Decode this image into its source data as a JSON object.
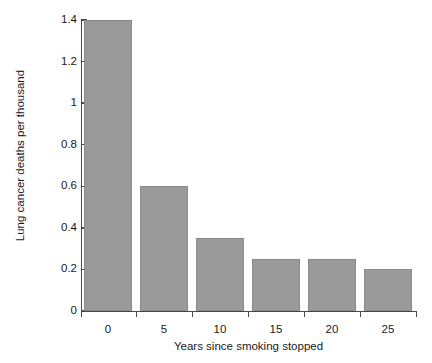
{
  "chart_data": {
    "type": "bar",
    "title": "",
    "xlabel": "Years since smoking stopped",
    "ylabel": "Lung cancer deaths per thousand",
    "categories": [
      "0",
      "5",
      "10",
      "15",
      "20",
      "25"
    ],
    "values": [
      1.4,
      0.6,
      0.35,
      0.25,
      0.25,
      0.2
    ],
    "series": [
      {
        "name": "Lung cancer deaths per thousand",
        "values": [
          1.4,
          0.6,
          0.35,
          0.25,
          0.25,
          0.2
        ]
      }
    ],
    "ylim": [
      0,
      1.4
    ],
    "yticks": [
      "0",
      "0.2",
      "0.4",
      "0.6",
      "0.8",
      "1",
      "1.2",
      "1.4"
    ],
    "ytick_values": [
      0,
      0.2,
      0.4,
      0.6,
      0.8,
      1,
      1.2,
      1.4
    ],
    "xticks": [
      "0",
      "5",
      "10",
      "15",
      "20",
      "25"
    ],
    "grid": false,
    "legend": false,
    "legend_position": "none",
    "bar_color": "#9a9a9a",
    "bar_edge_color": "#8a8a8a",
    "axis_color": "#4a4a4a",
    "background_color": "#ffffff"
  }
}
